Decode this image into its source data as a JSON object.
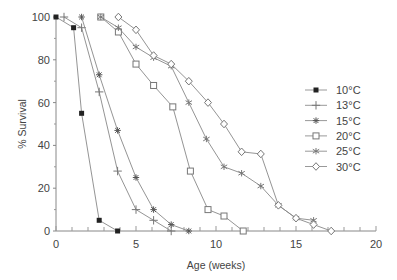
{
  "chart_data": {
    "type": "line",
    "title": "",
    "xlabel": "Age (weeks)",
    "ylabel": "% Survival",
    "xlim": [
      0,
      20
    ],
    "ylim": [
      0,
      100
    ],
    "xticks": [
      0,
      5,
      10,
      15,
      20
    ],
    "yticks": [
      0,
      20,
      40,
      60,
      80,
      100
    ],
    "grid": false,
    "legend_position": "right",
    "series": [
      {
        "name": "10°C",
        "marker": "filled-square",
        "x": [
          0,
          1.1,
          1.6,
          2.7,
          3.85
        ],
        "y": [
          100,
          95,
          55,
          5,
          0
        ]
      },
      {
        "name": "13°C",
        "marker": "plus",
        "x": [
          0.5,
          1.6,
          2.7,
          3.85,
          5.0,
          6.1,
          7.2
        ],
        "y": [
          100,
          95,
          65,
          28,
          10,
          5,
          0
        ]
      },
      {
        "name": "15°C",
        "marker": "asterisk",
        "x": [
          1.6,
          2.7,
          3.85,
          5.0,
          6.1,
          7.2,
          8.3
        ],
        "y": [
          100,
          73,
          47,
          25,
          10,
          3,
          0
        ]
      },
      {
        "name": "20°C",
        "marker": "open-square",
        "x": [
          2.8,
          3.9,
          5.0,
          6.1,
          7.3,
          8.4,
          9.5,
          10.5,
          11.7
        ],
        "y": [
          100,
          93,
          78,
          68,
          58,
          28,
          10,
          7,
          0
        ]
      },
      {
        "name": "25°C",
        "marker": "x",
        "x": [
          2.8,
          3.9,
          5.0,
          6.1,
          7.2,
          8.3,
          9.4,
          10.5,
          11.6,
          12.8,
          13.9,
          15.0,
          16.1
        ],
        "y": [
          100,
          95,
          86,
          81,
          77,
          60,
          43,
          30,
          27,
          21,
          12,
          6,
          5
        ]
      },
      {
        "name": "30°C",
        "marker": "open-diamond",
        "x": [
          3.9,
          5.0,
          6.1,
          7.2,
          8.3,
          9.5,
          10.5,
          11.6,
          12.8,
          13.9,
          15.0,
          16.1,
          17.2
        ],
        "y": [
          100,
          94,
          82,
          78,
          70,
          60,
          50,
          37,
          36,
          12,
          6,
          3,
          0
        ]
      }
    ]
  }
}
